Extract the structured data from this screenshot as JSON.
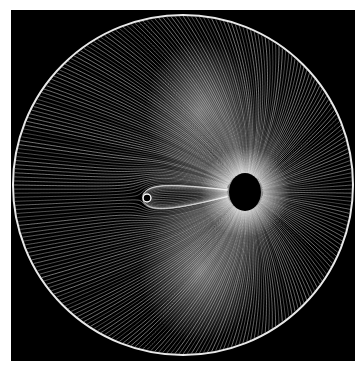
{
  "image": {
    "subject": "streamline field pattern inside a circular boundary",
    "description": "White flow lines on black background converging radially toward a dark hole, with a small ring source to the left",
    "colors": {
      "background": "#000000",
      "page": "#ffffff",
      "lines": "#ffffff",
      "glow": "#d8d8d8"
    },
    "elements": [
      "outer-circle-boundary",
      "central-sink-hole",
      "small-ring-source",
      "flow-lines",
      "bright-lobe-upper",
      "bright-lobe-lower"
    ]
  }
}
